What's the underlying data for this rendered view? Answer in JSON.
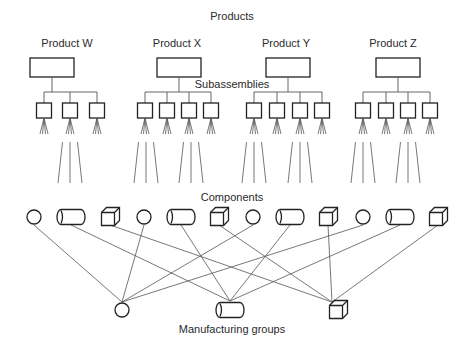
{
  "title": "Products",
  "labels": {
    "subassemblies": "Subassemblies",
    "components": "Components",
    "manufacturing_groups": "Manufacturing groups"
  },
  "colors": {
    "stroke": "#222222",
    "line": "#555555",
    "text": "#2a2a2a",
    "background": "#ffffff"
  },
  "products": [
    {
      "name": "Product W",
      "label_x": 67,
      "box_x": 30,
      "subassemblies": [
        44,
        70,
        97
      ]
    },
    {
      "name": "Product X",
      "label_x": 177,
      "box_x": 157,
      "subassemblies": [
        145,
        167,
        189,
        211
      ]
    },
    {
      "name": "Product Y",
      "label_x": 286,
      "box_x": 266,
      "subassemblies": [
        254,
        277,
        300,
        322
      ]
    },
    {
      "name": "Product Z",
      "label_x": 393,
      "box_x": 376,
      "subassemblies": [
        363,
        386,
        408,
        430
      ]
    }
  ],
  "spread_lines": [
    {
      "center": 70
    },
    {
      "center": 146
    },
    {
      "center": 191
    },
    {
      "center": 254
    },
    {
      "center": 300
    },
    {
      "center": 363
    },
    {
      "center": 408
    }
  ],
  "components": [
    {
      "group": 1,
      "circle_x": 34,
      "cylinder_x": 71,
      "cube_x": 110
    },
    {
      "group": 2,
      "circle_x": 144,
      "cylinder_x": 181,
      "cube_x": 219
    },
    {
      "group": 3,
      "circle_x": 253,
      "cylinder_x": 290,
      "cube_x": 328
    },
    {
      "group": 4,
      "circle_x": 363,
      "cylinder_x": 400,
      "cube_x": 438
    }
  ],
  "component_types": [
    "circle",
    "cylinder",
    "cube"
  ],
  "manufacturing_groups": [
    {
      "type": "circle",
      "x": 122,
      "y": 310
    },
    {
      "type": "cylinder",
      "x": 230,
      "y": 310
    },
    {
      "type": "cube",
      "x": 338,
      "y": 310
    }
  ]
}
